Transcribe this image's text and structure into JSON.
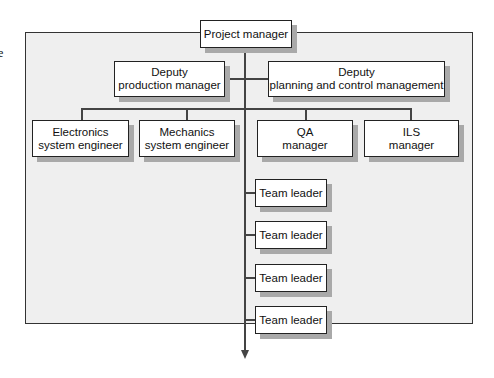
{
  "diagram": {
    "type": "organization-chart",
    "edge_fragment": "e",
    "root": {
      "line1": "Project manager"
    },
    "deputies": [
      {
        "line1": "Deputy",
        "line2": "production manager"
      },
      {
        "line1": "Deputy",
        "line2": "planning and control management"
      }
    ],
    "functional": [
      {
        "line1": "Electronics",
        "line2": "system engineer"
      },
      {
        "line1": "Mechanics",
        "line2": "system engineer"
      },
      {
        "line1": "QA",
        "line2": "manager"
      },
      {
        "line1": "ILS",
        "line2": "manager"
      }
    ],
    "team_leaders": [
      {
        "line1": "Team leader"
      },
      {
        "line1": "Team leader"
      },
      {
        "line1": "Team leader"
      },
      {
        "line1": "Team leader"
      }
    ],
    "colors": {
      "frame_fill": "#efefef",
      "box_fill": "#ffffff",
      "shadow": "#a9a9a9",
      "line": "#444444"
    }
  }
}
